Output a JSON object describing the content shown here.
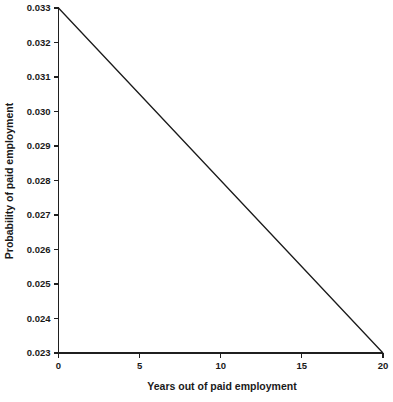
{
  "chart_data": {
    "type": "line",
    "title": "",
    "xlabel": "Years out of paid employment",
    "ylabel": "Probability of paid employment",
    "x": [
      0,
      20
    ],
    "values": [
      0.033,
      0.023
    ],
    "series": [
      {
        "name": "Probability of paid employment",
        "x": [
          0,
          1,
          2,
          3,
          4,
          5,
          6,
          7,
          8,
          9,
          10,
          11,
          12,
          13,
          14,
          15,
          16,
          17,
          18,
          19,
          20
        ],
        "values": [
          0.033,
          0.0325,
          0.032,
          0.0315,
          0.031,
          0.0305,
          0.03,
          0.0295,
          0.029,
          0.0285,
          0.028,
          0.0275,
          0.027,
          0.0265,
          0.026,
          0.0255,
          0.025,
          0.0245,
          0.024,
          0.0235,
          0.023
        ],
        "color": "#1a1a1a"
      }
    ],
    "xlim": [
      0,
      20
    ],
    "ylim": [
      0.023,
      0.033
    ],
    "xticks": [
      0,
      5,
      10,
      15,
      20
    ],
    "xtick_labels": [
      "0",
      "5",
      "10",
      "15",
      "20"
    ],
    "yticks": [
      0.023,
      0.024,
      0.025,
      0.026,
      0.027,
      0.028,
      0.029,
      0.03,
      0.031,
      0.032,
      0.033
    ],
    "ytick_labels": [
      "0.023",
      "0.024",
      "0.025",
      "0.026",
      "0.027",
      "0.028",
      "0.029",
      "0.030",
      "0.031",
      "0.032",
      "0.033"
    ],
    "grid": false,
    "legend": false,
    "legend_position": "none",
    "line_color": "#1a1a1a",
    "background_color": "#ffffff",
    "axis_color": "#1f1f1f"
  }
}
